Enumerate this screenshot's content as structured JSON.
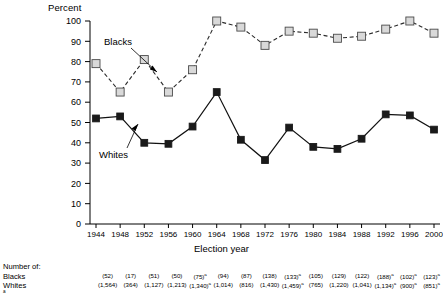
{
  "chart_data": {
    "type": "line",
    "title": "",
    "ylabel": "Percent",
    "xlabel": "Election year",
    "ylim": [
      0,
      100
    ],
    "ytick_labels": [
      "100",
      "90",
      "80",
      "70",
      "60",
      "50",
      "40",
      "30",
      "20",
      "10",
      "0"
    ],
    "ytick_values": [
      100,
      90,
      80,
      70,
      60,
      50,
      40,
      30,
      20,
      10,
      0
    ],
    "grid": false,
    "legend_position": "inline-annotation",
    "categories": [
      "1944",
      "1948",
      "1952",
      "1956",
      "1960",
      "1964",
      "1968",
      "1972",
      "1976",
      "1980",
      "1984",
      "1988",
      "1992",
      "1996",
      "2000"
    ],
    "x": [
      1944,
      1948,
      1952,
      1956,
      1960,
      1964,
      1968,
      1972,
      1976,
      1980,
      1984,
      1988,
      1992,
      1996,
      2000
    ],
    "series": [
      {
        "name": "Blacks",
        "marker": "open-square",
        "linestyle": "dashed",
        "color": "#d9d9d9",
        "values": [
          79,
          65,
          81,
          65,
          76,
          100,
          97,
          88,
          95,
          94,
          91.5,
          92.5,
          96,
          100,
          94
        ]
      },
      {
        "name": "Whites",
        "marker": "filled-square",
        "linestyle": "solid",
        "color": "#1a1a1a",
        "values": [
          52,
          53,
          40,
          39.5,
          48,
          65,
          41.5,
          31.5,
          47.5,
          38,
          37,
          42,
          54,
          53.5,
          46.5
        ]
      }
    ],
    "annotations": [
      {
        "text": "Blacks",
        "target_year": 1956
      },
      {
        "text": "Whites",
        "target_year": 1948
      }
    ]
  },
  "counts_table": {
    "heading": "Number of:",
    "row_labels": [
      "Blacks",
      "Whites"
    ],
    "blacks": [
      {
        "value": "(52)",
        "footnote": ""
      },
      {
        "value": "(17)",
        "footnote": ""
      },
      {
        "value": "(51)",
        "footnote": ""
      },
      {
        "value": "(50)",
        "footnote": ""
      },
      {
        "value": "(75)",
        "footnote": "a"
      },
      {
        "value": "(94)",
        "footnote": ""
      },
      {
        "value": "(87)",
        "footnote": ""
      },
      {
        "value": "(138)",
        "footnote": ""
      },
      {
        "value": "(133)",
        "footnote": "a"
      },
      {
        "value": "(105)",
        "footnote": ""
      },
      {
        "value": "(129)",
        "footnote": ""
      },
      {
        "value": "(122)",
        "footnote": ""
      },
      {
        "value": "(188)",
        "footnote": "a"
      },
      {
        "value": "(102)",
        "footnote": "a"
      },
      {
        "value": "(123)",
        "footnote": "a"
      }
    ],
    "whites": [
      {
        "value": "(1,564)",
        "footnote": ""
      },
      {
        "value": "(364)",
        "footnote": ""
      },
      {
        "value": "(1,127)",
        "footnote": ""
      },
      {
        "value": "(1,213)",
        "footnote": ""
      },
      {
        "value": "(1,340)",
        "footnote": "a"
      },
      {
        "value": "(1,014)",
        "footnote": ""
      },
      {
        "value": "(816)",
        "footnote": ""
      },
      {
        "value": "(1,430)",
        "footnote": ""
      },
      {
        "value": "(1,459)",
        "footnote": "a"
      },
      {
        "value": "(765)",
        "footnote": ""
      },
      {
        "value": "(1,220)",
        "footnote": ""
      },
      {
        "value": "(1,041)",
        "footnote": ""
      },
      {
        "value": "(1,134)",
        "footnote": "a"
      },
      {
        "value": "(900)",
        "footnote": "a"
      },
      {
        "value": "(851)",
        "footnote": "a"
      }
    ]
  },
  "footnote_marker": "a"
}
